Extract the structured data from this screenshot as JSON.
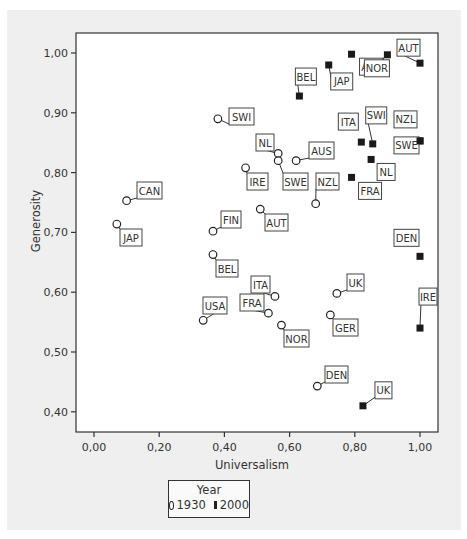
{
  "chart_data": {
    "type": "scatter",
    "title": "",
    "xlabel": "Universalism",
    "ylabel": "Generosity",
    "xlim": [
      -0.05,
      1.05
    ],
    "ylim": [
      0.37,
      1.03
    ],
    "xticks": [
      "0,00",
      "0,20",
      "0,40",
      "0,60",
      "0,80",
      "1,00"
    ],
    "yticks": [
      "0,40",
      "0,50",
      "0,60",
      "0,70",
      "0,80",
      "0,90",
      "1,00"
    ],
    "grid": false,
    "legend": {
      "title": "Year",
      "position": "bottom",
      "entries": [
        "1930",
        "2000"
      ]
    },
    "series": [
      {
        "name": "1930",
        "marker": "open-circle",
        "points": [
          {
            "label": "SWI",
            "x": 0.38,
            "y": 0.89
          },
          {
            "label": "CAN",
            "x": 0.1,
            "y": 0.753
          },
          {
            "label": "JAP",
            "x": 0.07,
            "y": 0.714
          },
          {
            "label": "NL",
            "x": 0.565,
            "y": 0.832
          },
          {
            "label": "SWE",
            "x": 0.565,
            "y": 0.82
          },
          {
            "label": "AUS",
            "x": 0.62,
            "y": 0.82
          },
          {
            "label": "IRE",
            "x": 0.465,
            "y": 0.808
          },
          {
            "label": "NZL",
            "x": 0.68,
            "y": 0.748
          },
          {
            "label": "FIN",
            "x": 0.365,
            "y": 0.702
          },
          {
            "label": "AUT",
            "x": 0.51,
            "y": 0.739
          },
          {
            "label": "BEL",
            "x": 0.365,
            "y": 0.663
          },
          {
            "label": "USA",
            "x": 0.335,
            "y": 0.553
          },
          {
            "label": "ITA",
            "x": 0.555,
            "y": 0.593
          },
          {
            "label": "FRA",
            "x": 0.535,
            "y": 0.565
          },
          {
            "label": "NOR",
            "x": 0.575,
            "y": 0.545
          },
          {
            "label": "UK",
            "x": 0.745,
            "y": 0.598
          },
          {
            "label": "GER",
            "x": 0.725,
            "y": 0.562
          },
          {
            "label": "DEN",
            "x": 0.685,
            "y": 0.443
          }
        ]
      },
      {
        "name": "2000",
        "marker": "filled-square",
        "points": [
          {
            "label": "AUS",
            "x": 0.79,
            "y": 0.998
          },
          {
            "label": "AUT",
            "x": 1.0,
            "y": 0.983
          },
          {
            "label": "NOR",
            "x": 0.9,
            "y": 0.997
          },
          {
            "label": "JAP",
            "x": 0.72,
            "y": 0.98
          },
          {
            "label": "BEL",
            "x": 0.63,
            "y": 0.928
          },
          {
            "label": "ITA",
            "x": 0.82,
            "y": 0.851
          },
          {
            "label": "SWI",
            "x": 0.855,
            "y": 0.848
          },
          {
            "label": "NZL",
            "x": 1.0,
            "y": 0.853
          },
          {
            "label": "NL",
            "x": 0.85,
            "y": 0.822
          },
          {
            "label": "SWE",
            "x": 1.0,
            "y": 0.853
          },
          {
            "label": "FRA",
            "x": 0.79,
            "y": 0.792
          },
          {
            "label": "DEN",
            "x": 1.0,
            "y": 0.66
          },
          {
            "label": "IRE",
            "x": 1.0,
            "y": 0.54
          },
          {
            "label": "UK",
            "x": 0.825,
            "y": 0.41
          }
        ]
      }
    ]
  },
  "plot": {
    "x_axis_title": "Universalism",
    "y_axis_title": "Generosity"
  },
  "legend": {
    "title": "Year",
    "entries": [
      {
        "label": "1930",
        "marker": "open-circle"
      },
      {
        "label": "2000",
        "marker": "filled-square"
      }
    ]
  },
  "labels_layout": [
    {
      "t": "SWI",
      "px": 385,
      "py": 147,
      "lx": 229,
      "ly": 108,
      "w": 25
    },
    {
      "t": "CAN",
      "px": 127,
      "py": 200,
      "lx": 137,
      "ly": 182,
      "w": 25
    },
    {
      "t": "JAP",
      "px": 117,
      "py": 223,
      "lx": 120,
      "ly": 229,
      "w": 22
    },
    {
      "t": "NL",
      "px": 276,
      "py": 154,
      "lx": 256,
      "ly": 134,
      "w": 18
    },
    {
      "t": "SWE",
      "px": 276,
      "py": 161,
      "lx": 283,
      "ly": 173,
      "w": 25
    },
    {
      "t": "AUS",
      "px": 300,
      "py": 161,
      "lx": 309,
      "ly": 142,
      "w": 25
    },
    {
      "t": "IRE",
      "px": 244,
      "py": 169,
      "lx": 247,
      "ly": 173,
      "w": 21
    },
    {
      "t": "NZL",
      "px": 316,
      "py": 203,
      "lx": 316,
      "ly": 173,
      "w": 23
    },
    {
      "t": "FIN",
      "px": 212,
      "py": 231,
      "lx": 221,
      "ly": 211,
      "w": 20
    },
    {
      "t": "AUT",
      "px": 261,
      "py": 210,
      "lx": 265,
      "ly": 214,
      "w": 23
    },
    {
      "t": "BEL",
      "px": 212,
      "py": 255,
      "lx": 216,
      "ly": 260,
      "w": 22
    },
    {
      "t": "USA",
      "px": 203,
      "py": 320,
      "lx": 203,
      "ly": 297,
      "w": 24
    },
    {
      "t": "ITA",
      "px": 273,
      "py": 296,
      "lx": 251,
      "ly": 276,
      "w": 19
    },
    {
      "t": "FRA",
      "px": 267,
      "py": 313,
      "lx": 240,
      "ly": 294,
      "w": 24
    },
    {
      "t": "NOR",
      "px": 280,
      "py": 325,
      "lx": 284,
      "ly": 330,
      "w": 25
    },
    {
      "t": "UK",
      "px": 335,
      "py": 293,
      "lx": 347,
      "ly": 274,
      "w": 17
    },
    {
      "t": "GER",
      "px": 328,
      "py": 314,
      "lx": 333,
      "ly": 319,
      "w": 25
    },
    {
      "t": "DEN",
      "px": 316,
      "py": 386,
      "lx": 325,
      "ly": 366,
      "w": 23
    }
  ]
}
